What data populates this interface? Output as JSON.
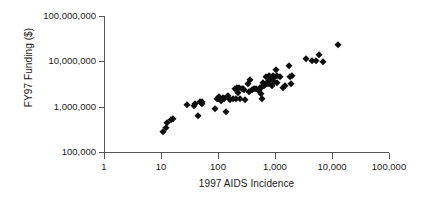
{
  "chart_data": {
    "type": "scatter",
    "title": "",
    "xlabel": "1997 AIDS Incidence",
    "ylabel": "FY97 Funding ($)",
    "xscale": "log",
    "yscale": "log",
    "xlim": [
      1,
      100000
    ],
    "ylim": [
      100000,
      100000000
    ],
    "grid": false,
    "legend": null,
    "marker": {
      "shape": "diamond",
      "color": "#0d0d0d",
      "size_px": 5.4
    },
    "axis_color": "#555555",
    "xticks": [
      1,
      10,
      100,
      1000,
      10000,
      100000
    ],
    "xtick_labels": [
      "1",
      "10",
      "100",
      "1,000",
      "10,000",
      "100,000"
    ],
    "yticks": [
      100000,
      1000000,
      10000000,
      100000000
    ],
    "ytick_labels": [
      "100,000",
      "1,000,000",
      "10,000,000",
      "100,000,000"
    ],
    "n_points": 73,
    "points": [
      [
        11,
        280000
      ],
      [
        12,
        330000
      ],
      [
        13,
        440000
      ],
      [
        15,
        520000
      ],
      [
        16,
        540000
      ],
      [
        29,
        1100000
      ],
      [
        38,
        1050000
      ],
      [
        40,
        1150000
      ],
      [
        44,
        620000
      ],
      [
        48,
        1250000
      ],
      [
        50,
        1200000
      ],
      [
        52,
        1300000
      ],
      [
        53,
        1150000
      ],
      [
        88,
        880000
      ],
      [
        95,
        1500000
      ],
      [
        100,
        1450000
      ],
      [
        105,
        1600000
      ],
      [
        112,
        1350000
      ],
      [
        120,
        1550000
      ],
      [
        130,
        1500000
      ],
      [
        140,
        780000
      ],
      [
        145,
        1650000
      ],
      [
        150,
        1700000
      ],
      [
        160,
        1400000
      ],
      [
        185,
        1450000
      ],
      [
        200,
        2400000
      ],
      [
        205,
        1500000
      ],
      [
        215,
        2600000
      ],
      [
        225,
        2000000
      ],
      [
        235,
        2550000
      ],
      [
        245,
        1480000
      ],
      [
        265,
        2450000
      ],
      [
        275,
        2500000
      ],
      [
        290,
        2350000
      ],
      [
        300,
        1420000
      ],
      [
        330,
        3100000
      ],
      [
        350,
        2100000
      ],
      [
        370,
        3900000
      ],
      [
        400,
        2300000
      ],
      [
        430,
        2450000
      ],
      [
        470,
        2500000
      ],
      [
        520,
        2250000
      ],
      [
        540,
        2600000
      ],
      [
        560,
        1950000
      ],
      [
        580,
        2750000
      ],
      [
        600,
        1500000
      ],
      [
        620,
        3300000
      ],
      [
        650,
        2800000
      ],
      [
        680,
        3000000
      ],
      [
        700,
        4600000
      ],
      [
        720,
        3400000
      ],
      [
        750,
        3150000
      ],
      [
        780,
        4800000
      ],
      [
        800,
        3600000
      ],
      [
        830,
        4400000
      ],
      [
        870,
        2900000
      ],
      [
        900,
        4300000
      ],
      [
        940,
        4700000
      ],
      [
        980,
        3500000
      ],
      [
        1000,
        4500000
      ],
      [
        1050,
        6300000
      ],
      [
        1080,
        4800000
      ],
      [
        1100,
        3300000
      ],
      [
        1200,
        4450000
      ],
      [
        1400,
        2600000
      ],
      [
        1500,
        2900000
      ],
      [
        1750,
        7800000
      ],
      [
        1850,
        4400000
      ],
      [
        1900,
        3100000
      ],
      [
        1950,
        4700000
      ],
      [
        3500,
        11000000
      ],
      [
        4500,
        10000000
      ],
      [
        5200,
        10200000
      ],
      [
        6000,
        13500000
      ],
      [
        7000,
        9800000
      ],
      [
        13000,
        23000000
      ]
    ]
  },
  "axes": {
    "y_title": "FY97 Funding ($)",
    "x_title": "1997 AIDS Incidence"
  }
}
